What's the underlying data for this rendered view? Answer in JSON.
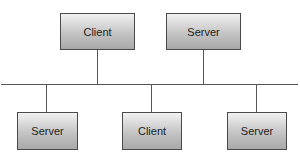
{
  "diagram": {
    "type": "bus-network",
    "top_nodes": [
      {
        "label": "Client"
      },
      {
        "label": "Server"
      }
    ],
    "bottom_nodes": [
      {
        "label": "Server"
      },
      {
        "label": "Client"
      },
      {
        "label": "Server"
      }
    ],
    "colors": {
      "border": "#4a4a4a",
      "line": "#555555",
      "box_top": "#f2f2f2",
      "box_bottom": "#a9a9a9"
    }
  }
}
